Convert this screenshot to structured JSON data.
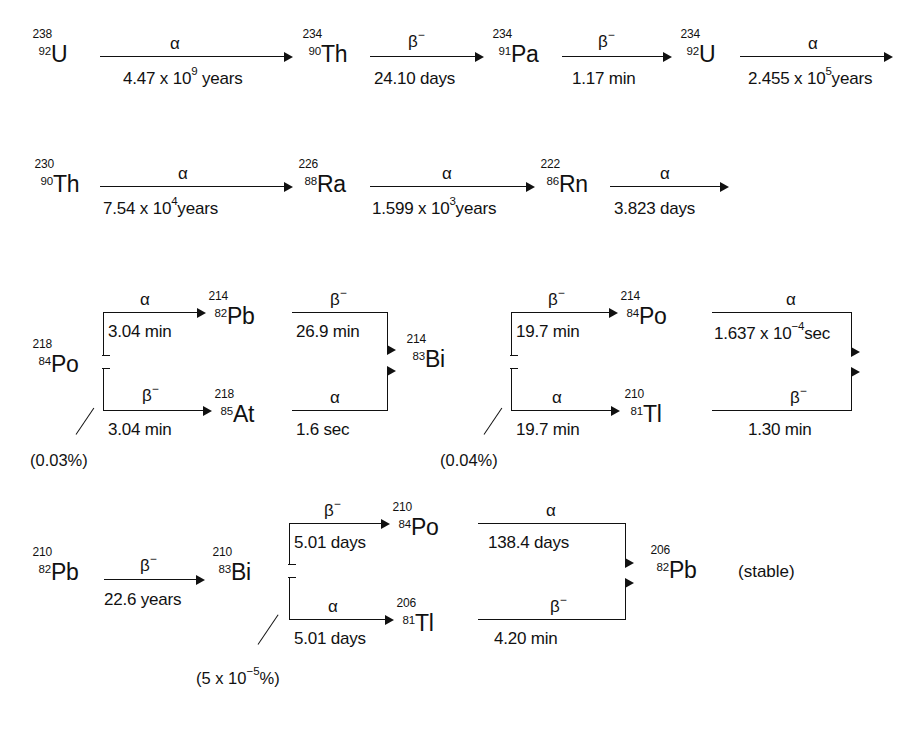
{
  "symbols": {
    "alpha": "α",
    "beta_minus_base": "β",
    "beta_minus_sup": "−",
    "times": "x"
  },
  "rows": [
    {
      "id": "row-1",
      "nuclides": [
        {
          "id": "u-238",
          "mass": "238",
          "element": "U",
          "atomic": "92"
        },
        {
          "id": "th-234",
          "mass": "234",
          "element": "Th",
          "atomic": "90"
        },
        {
          "id": "pa-234",
          "mass": "234",
          "element": "Pa",
          "atomic": "91"
        },
        {
          "id": "u-234",
          "mass": "234",
          "element": "U",
          "atomic": "92"
        }
      ],
      "decays": [
        {
          "id": "u238-to-th234",
          "mode": "α",
          "mode_sup": "",
          "halflife_pre": "4.47 x 10",
          "halflife_exp": "9",
          "halflife_post": " years"
        },
        {
          "id": "th234-to-pa234",
          "mode": "β",
          "mode_sup": "−",
          "halflife_pre": "24.10 days",
          "halflife_exp": "",
          "halflife_post": ""
        },
        {
          "id": "pa234-to-u234",
          "mode": "β",
          "mode_sup": "−",
          "halflife_pre": "1.17 min",
          "halflife_exp": "",
          "halflife_post": ""
        },
        {
          "id": "u234-to-th230",
          "mode": "α",
          "mode_sup": "",
          "halflife_pre": "2.455 x 10",
          "halflife_exp": "5",
          "halflife_post": "years"
        }
      ]
    },
    {
      "id": "row-2",
      "nuclides": [
        {
          "id": "th-230",
          "mass": "230",
          "element": "Th",
          "atomic": "90"
        },
        {
          "id": "ra-226",
          "mass": "226",
          "element": "Ra",
          "atomic": "88"
        },
        {
          "id": "rn-222",
          "mass": "222",
          "element": "Rn",
          "atomic": "86"
        }
      ],
      "decays": [
        {
          "id": "th230-to-ra226",
          "mode": "α",
          "mode_sup": "",
          "halflife_pre": "7.54 x 10",
          "halflife_exp": "4",
          "halflife_post": "years"
        },
        {
          "id": "ra226-to-rn222",
          "mode": "α",
          "mode_sup": "",
          "halflife_pre": "1.599 x 10",
          "halflife_exp": "3",
          "halflife_post": "years"
        },
        {
          "id": "rn222-to-po218",
          "mode": "α",
          "mode_sup": "",
          "halflife_pre": "3.823 days",
          "halflife_exp": "",
          "halflife_post": ""
        }
      ]
    },
    {
      "id": "row-3",
      "nuclides": [
        {
          "id": "po-218",
          "mass": "218",
          "element": "Po",
          "atomic": "84"
        },
        {
          "id": "pb-214",
          "mass": "214",
          "element": "Pb",
          "atomic": "82"
        },
        {
          "id": "at-218",
          "mass": "218",
          "element": "At",
          "atomic": "85"
        },
        {
          "id": "bi-214",
          "mass": "214",
          "element": "Bi",
          "atomic": "83"
        },
        {
          "id": "po-214",
          "mass": "214",
          "element": "Po",
          "atomic": "84"
        },
        {
          "id": "tl-210",
          "mass": "210",
          "element": "Tl",
          "atomic": "81"
        }
      ],
      "decays": [
        {
          "id": "po218-to-pb214",
          "mode": "α",
          "mode_sup": "",
          "halflife_pre": "3.04 min",
          "halflife_exp": "",
          "halflife_post": ""
        },
        {
          "id": "po218-to-at218",
          "mode": "β",
          "mode_sup": "−",
          "halflife_pre": "3.04 min",
          "halflife_exp": "",
          "halflife_post": ""
        },
        {
          "id": "pb214-to-bi214",
          "mode": "β",
          "mode_sup": "−",
          "halflife_pre": "26.9 min",
          "halflife_exp": "",
          "halflife_post": ""
        },
        {
          "id": "at218-to-bi214",
          "mode": "α",
          "mode_sup": "",
          "halflife_pre": "1.6 sec",
          "halflife_exp": "",
          "halflife_post": ""
        },
        {
          "id": "bi214-to-po214",
          "mode": "β",
          "mode_sup": "−",
          "halflife_pre": "19.7 min",
          "halflife_exp": "",
          "halflife_post": ""
        },
        {
          "id": "bi214-to-tl210",
          "mode": "α",
          "mode_sup": "",
          "halflife_pre": "19.7 min",
          "halflife_exp": "",
          "halflife_post": ""
        },
        {
          "id": "po214-to-pb210",
          "mode": "α",
          "mode_sup": "",
          "halflife_pre": "1.637 x 10",
          "halflife_exp": "−4",
          "halflife_post": "sec"
        },
        {
          "id": "tl210-to-pb210",
          "mode": "β",
          "mode_sup": "−",
          "halflife_pre": "1.30 min",
          "halflife_exp": "",
          "halflife_post": ""
        }
      ],
      "branch_labels": [
        {
          "id": "branch-at218",
          "text": "(0.03%)"
        },
        {
          "id": "branch-tl210",
          "text": "(0.04%)"
        }
      ]
    },
    {
      "id": "row-4",
      "nuclides": [
        {
          "id": "pb-210",
          "mass": "210",
          "element": "Pb",
          "atomic": "82"
        },
        {
          "id": "bi-210",
          "mass": "210",
          "element": "Bi",
          "atomic": "83"
        },
        {
          "id": "po-210",
          "mass": "210",
          "element": "Po",
          "atomic": "84"
        },
        {
          "id": "tl-206",
          "mass": "206",
          "element": "Tl",
          "atomic": "81"
        },
        {
          "id": "pb-206",
          "mass": "206",
          "element": "Pb",
          "atomic": "82"
        }
      ],
      "decays": [
        {
          "id": "pb210-to-bi210",
          "mode": "β",
          "mode_sup": "−",
          "halflife_pre": "22.6 years",
          "halflife_exp": "",
          "halflife_post": ""
        },
        {
          "id": "bi210-to-po210",
          "mode": "β",
          "mode_sup": "−",
          "halflife_pre": "5.01 days",
          "halflife_exp": "",
          "halflife_post": ""
        },
        {
          "id": "bi210-to-tl206",
          "mode": "α",
          "mode_sup": "",
          "halflife_pre": "5.01 days",
          "halflife_exp": "",
          "halflife_post": ""
        },
        {
          "id": "po210-to-pb206",
          "mode": "α",
          "mode_sup": "",
          "halflife_pre": "138.4 days",
          "halflife_exp": "",
          "halflife_post": ""
        },
        {
          "id": "tl206-to-pb206",
          "mode": "β",
          "mode_sup": "−",
          "halflife_pre": "4.20 min",
          "halflife_exp": "",
          "halflife_post": ""
        }
      ],
      "branch_labels": [
        {
          "id": "branch-tl206",
          "text_pre": "(5 x 10",
          "text_exp": "−5",
          "text_post": "%)"
        }
      ],
      "end_note": "(stable)"
    }
  ]
}
